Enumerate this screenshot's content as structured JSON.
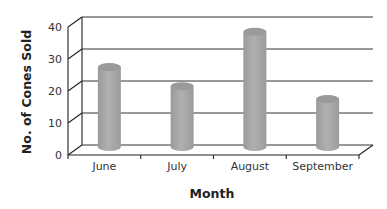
{
  "chart_data": {
    "type": "bar",
    "style": "3d-cylinder",
    "title": "",
    "xlabel": "Month",
    "ylabel": "No. of Cones Sold",
    "categories": [
      "June",
      "July",
      "August",
      "September"
    ],
    "values": [
      25,
      19,
      36,
      15
    ],
    "ylim": [
      0,
      40
    ],
    "yticks": [
      0,
      10,
      20,
      30,
      40
    ],
    "grid": true,
    "legend": null,
    "colors": {
      "bar": "#a6a6a6",
      "bar_top": "#9a9a9a",
      "grid": "#333333",
      "frame": "#222222"
    }
  }
}
